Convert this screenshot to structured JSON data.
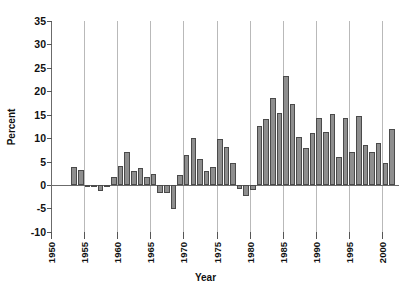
{
  "chart_data": {
    "type": "bar",
    "title": "",
    "xlabel": "Year",
    "ylabel": "Percent",
    "xlim": [
      1950,
      2002.5
    ],
    "ylim": [
      -10,
      35
    ],
    "ytick_values": [
      35,
      30,
      25,
      20,
      15,
      10,
      5,
      0,
      -5,
      -10
    ],
    "ytick_labels": [
      "35",
      "30",
      "25",
      "20",
      "15",
      "10",
      "5",
      "0",
      "-5",
      "-10"
    ],
    "xtick_values": [
      1950,
      1955,
      1960,
      1965,
      1970,
      1975,
      1980,
      1985,
      1990,
      1995,
      2000
    ],
    "xtick_labels": [
      "1950",
      "1955",
      "1960",
      "1965",
      "1970",
      "1975",
      "1980",
      "1985",
      "1990",
      "1995",
      "2000"
    ],
    "grid": "vertical-only",
    "legend": "none",
    "bar_color": "#8e8e8e",
    "bar_edge_color": "#4a4a4a",
    "categories": [
      1953,
      1954,
      1955,
      1956,
      1957,
      1958,
      1959,
      1960,
      1961,
      1962,
      1963,
      1964,
      1965,
      1966,
      1967,
      1968,
      1969,
      1970,
      1971,
      1972,
      1973,
      1974,
      1975,
      1976,
      1977,
      1978,
      1979,
      1980,
      1981,
      1982,
      1983,
      1984,
      1985,
      1986,
      1987,
      1988,
      1989,
      1990,
      1991,
      1992,
      1993,
      1994,
      1995,
      1996,
      1997,
      1998,
      1999,
      2000,
      2001,
      2002
    ],
    "values": [
      3.9,
      3.2,
      0.1,
      -0.3,
      -1.2,
      0.1,
      1.7,
      4.1,
      7.0,
      3.0,
      3.7,
      1.7,
      2.4,
      -1.6,
      -1.7,
      -5.1,
      2.1,
      6.4,
      10.1,
      5.6,
      2.9,
      3.9,
      9.9,
      8.1,
      4.7,
      -0.9,
      -2.4,
      -1.1,
      12.6,
      14.1,
      18.6,
      15.4,
      23.3,
      17.3,
      10.2,
      7.9,
      11.0,
      14.2,
      11.3,
      15.2,
      5.9,
      14.2,
      7.0,
      14.7,
      8.5,
      7.1,
      8.9,
      4.7,
      12.0,
      0.0
    ]
  }
}
